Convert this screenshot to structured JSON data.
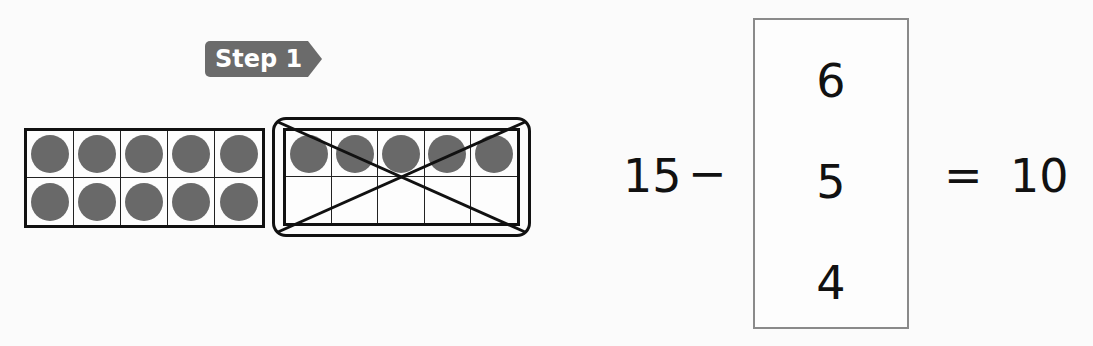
{
  "step_badge": {
    "label": "Step 1"
  },
  "ten_frames": [
    {
      "id": "left",
      "filled_top": 5,
      "filled_bottom": 5,
      "crossed_out": false
    },
    {
      "id": "right",
      "filled_top": 5,
      "filled_bottom": 0,
      "crossed_out": true
    }
  ],
  "equation": {
    "minuend": "15",
    "operator": "−",
    "equals": "=",
    "result": "10",
    "choices": [
      "6",
      "5",
      "4"
    ]
  },
  "colors": {
    "counter": "#696969",
    "badge": "#6b6b6b",
    "box_border": "#8a8a8a"
  }
}
